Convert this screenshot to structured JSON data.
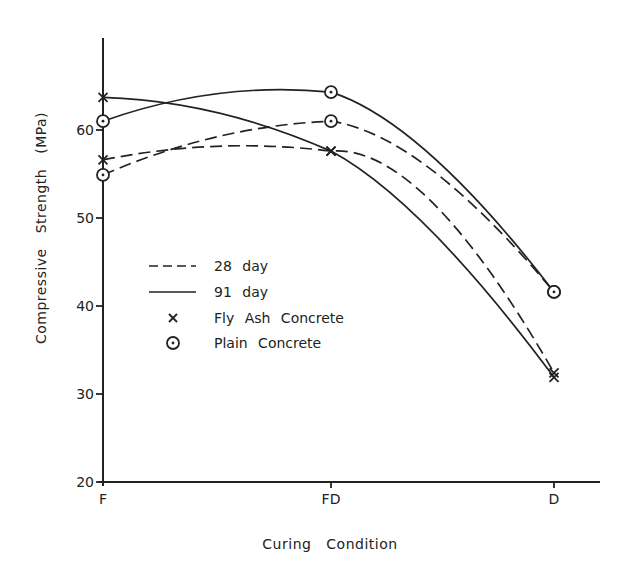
{
  "chart_data": {
    "type": "line",
    "title": "",
    "xlabel": "Curing Condition",
    "ylabel": "Compressive Strength (MPa)",
    "categories": [
      "F",
      "FD",
      "D"
    ],
    "ylim": [
      20,
      70
    ],
    "yticks": [
      20,
      30,
      40,
      50,
      60
    ],
    "grid": false,
    "legend_position": "inside-left-middle",
    "series": [
      {
        "name": "Fly Ash Concrete, 28 day",
        "material": "Fly Ash Concrete",
        "age": "28 day",
        "marker": "x",
        "line": "dashed",
        "values": [
          56.6,
          57.6,
          32.4
        ]
      },
      {
        "name": "Fly Ash Concrete, 91 day",
        "material": "Fly Ash Concrete",
        "age": "91 day",
        "marker": "x",
        "line": "solid",
        "values": [
          63.7,
          57.6,
          31.9
        ]
      },
      {
        "name": "Plain Concrete, 28 day",
        "material": "Plain Concrete",
        "age": "28 day",
        "marker": "circle-dot",
        "line": "dashed",
        "values": [
          54.9,
          61.0,
          41.6
        ]
      },
      {
        "name": "Plain Concrete, 91 day",
        "material": "Plain Concrete",
        "age": "91 day",
        "marker": "circle-dot",
        "line": "solid",
        "values": [
          61.0,
          64.3,
          41.6
        ]
      }
    ],
    "legend": [
      {
        "symbol": "dashed-line",
        "label": "28 day"
      },
      {
        "symbol": "solid-line",
        "label": "91 day"
      },
      {
        "symbol": "x",
        "label": "Fly Ash Concrete"
      },
      {
        "symbol": "circle-dot",
        "label": "Plain Concrete"
      }
    ]
  },
  "axes": {
    "x_label_words": [
      "Curing",
      "Condition"
    ],
    "y_label_words": [
      "Compressive",
      "Strength",
      "(MPa)"
    ]
  },
  "colors": {
    "ink": "#222222",
    "background": "#ffffff"
  }
}
